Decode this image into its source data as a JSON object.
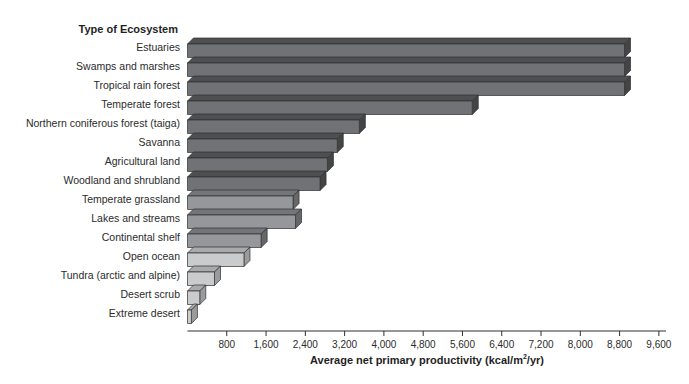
{
  "page": {
    "background": "#ffffff"
  },
  "chart_data": {
    "type": "bar",
    "orientation": "horizontal",
    "title": "",
    "ylabel": "Type of Ecosystem",
    "xlabel": "Average net primary productivity (kcal/m²/yr)",
    "xlabel_parts": {
      "pre": "Average net primary productivity (kcal/m",
      "sup": "2",
      "post": "/yr)"
    },
    "categories": [
      "Estuaries",
      "Swamps and marshes",
      "Tropical rain forest",
      "Temperate forest",
      "Northern coniferous forest (taiga)",
      "Savanna",
      "Agricultural land",
      "Woodland and shrubland",
      "Temperate grassland",
      "Lakes and streams",
      "Continental shelf",
      "Open ocean",
      "Tundra (arctic and alpine)",
      "Desert scrub",
      "Extreme desert"
    ],
    "values": [
      8900,
      8900,
      8900,
      5800,
      3500,
      3050,
      2850,
      2700,
      2150,
      2200,
      1500,
      1150,
      550,
      250,
      80
    ],
    "shades": [
      "dark",
      "dark",
      "dark",
      "dark",
      "dark",
      "dark",
      "dark",
      "dark",
      "medium",
      "medium",
      "medium",
      "light",
      "light",
      "light",
      "light"
    ],
    "shade_colors": {
      "dark": {
        "front": "#717275",
        "top": "#4e4f51",
        "side": "#434446"
      },
      "medium": {
        "front": "#96979a",
        "top": "#747578",
        "side": "#666769"
      },
      "light": {
        "front": "#cacbcd",
        "top": "#a9aaac",
        "side": "#9a9b9d"
      }
    },
    "xlim": [
      0,
      9600
    ],
    "xticks": [
      800,
      1600,
      2400,
      3200,
      4000,
      4800,
      5600,
      6400,
      7200,
      8000,
      8800,
      9600
    ],
    "xtick_labels": [
      "800",
      "1,600",
      "2,400",
      "3,200",
      "4,000",
      "4,800",
      "5,600",
      "6,400",
      "7,200",
      "8,000",
      "8,800",
      "9,600"
    ],
    "grid": false,
    "legend": false,
    "axis_color": "#2f2f31",
    "text_color": "#2b2b2b",
    "background": "#ffffff"
  }
}
